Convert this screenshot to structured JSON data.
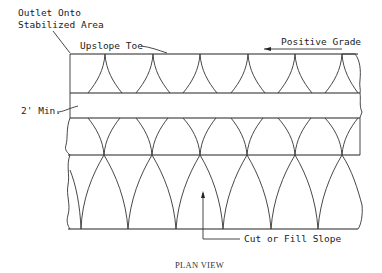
{
  "title": "PLAN VIEW",
  "labels": {
    "outlet_line1": "Outlet Onto",
    "outlet_line2": "Stabilized Area",
    "upslope_toe": "Upslope Toe",
    "positive_grade": "Positive Grade",
    "min_width": "2' Min.",
    "cut_fill": "Cut or Fill Slope"
  },
  "geometry": {
    "left_x": 70,
    "right_x": 358,
    "top_y": 54,
    "band_top_y": 93,
    "band_bottom_y": 118,
    "lower_y": 155,
    "bottom_y": 229,
    "upper_cusps_x": [
      105,
      153,
      200,
      248,
      295,
      342
    ],
    "lower_cusps_x": [
      104,
      152,
      200,
      247,
      295,
      342
    ],
    "bottom_cusps_x": [
      81,
      128,
      176,
      223,
      271,
      318
    ]
  },
  "colors": {
    "ink": "#222222",
    "background": "#ffffff"
  }
}
